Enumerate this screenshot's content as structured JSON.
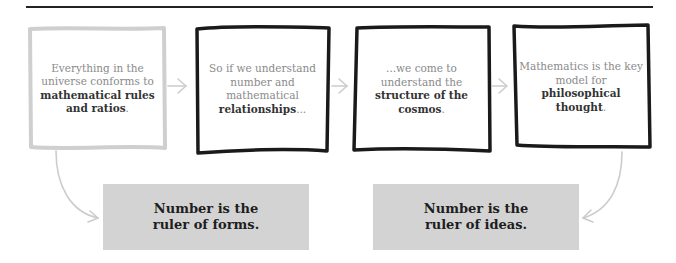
{
  "diagram": {
    "steps": [
      {
        "pre": "Everything in the universe conforms to ",
        "bold": "mathematical rules and ratios",
        "post": ".",
        "style": "light"
      },
      {
        "pre": "So if we understand number and mathematical ",
        "bold": "relationships",
        "post": "...",
        "style": "dark"
      },
      {
        "pre": "...we come to understand the ",
        "bold": "structure of the cosmos",
        "post": ".",
        "style": "dark"
      },
      {
        "pre": "Mathematics is the key model for ",
        "bold": "philosophical thought",
        "post": ".",
        "style": "dark"
      }
    ],
    "conclusions": [
      {
        "line1": "Number is the",
        "line2": "ruler of forms."
      },
      {
        "line1": "Number is the",
        "line2": "ruler of ideas."
      }
    ],
    "colors": {
      "rule": "#222222",
      "light_frame": "#cfcfcf",
      "dark_frame": "#1a1a1a",
      "arrow": "#cccccc",
      "conclusion_bg": "#d3d3d3"
    }
  }
}
